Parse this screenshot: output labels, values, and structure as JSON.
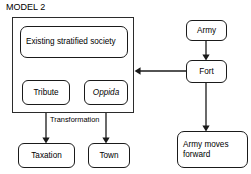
{
  "title": "MODEL 2",
  "colors": {
    "background": "#ffffff",
    "stroke": "#1a1a1a",
    "group_stroke": "#2b2b2b",
    "text": "#000000"
  },
  "group": {
    "name": "existing-society-group"
  },
  "nodes": {
    "existing_society": "Existing stratified society",
    "tribute": "Tribute",
    "oppida": "Oppida",
    "taxation": "Taxation",
    "town": "Town",
    "army": "Army",
    "fort": "Fort",
    "army_moves_forward": "Army moves forward"
  },
  "edge_labels": {
    "transformation": "Transformation"
  },
  "edges": [
    {
      "from": "existing_society",
      "to": "tribute",
      "label": ""
    },
    {
      "from": "existing_society",
      "to": "oppida",
      "label": ""
    },
    {
      "from": "tribute",
      "to": "taxation",
      "label": "Transformation"
    },
    {
      "from": "oppida",
      "to": "town",
      "label": "Transformation"
    },
    {
      "from": "army",
      "to": "fort",
      "label": ""
    },
    {
      "from": "fort",
      "to": "existing-society-group",
      "label": ""
    },
    {
      "from": "fort",
      "to": "army_moves_forward",
      "label": ""
    }
  ]
}
